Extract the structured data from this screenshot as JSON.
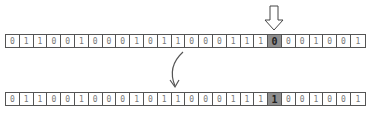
{
  "diagram": {
    "before_bits": [
      "0",
      "1",
      "1",
      "0",
      "0",
      "1",
      "0",
      "0",
      "0",
      "1",
      "0",
      "1",
      "1",
      "0",
      "0",
      "0",
      "1",
      "1",
      "1",
      "0",
      "0",
      "0",
      "1",
      "0",
      "0",
      "1"
    ],
    "after_bits": [
      "0",
      "1",
      "1",
      "0",
      "0",
      "1",
      "0",
      "0",
      "0",
      "1",
      "0",
      "1",
      "1",
      "0",
      "0",
      "0",
      "1",
      "1",
      "1",
      "1",
      "0",
      "0",
      "1",
      "0",
      "0",
      "1"
    ],
    "highlight_index": 19,
    "highlight_color": "#8f8f8f",
    "pointer": "down-arrow-icon",
    "transition": "curved-arrow-icon"
  }
}
